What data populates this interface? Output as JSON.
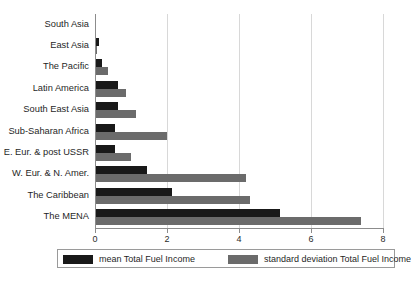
{
  "chart_data": {
    "type": "bar",
    "orientation": "horizontal",
    "title": "",
    "subtitle": "",
    "xlabel": "",
    "ylabel": "",
    "xlim": [
      0,
      8
    ],
    "ylim": null,
    "grid": true,
    "gridlines": "vertical",
    "legend_position": "bottom",
    "xticks": [
      "0",
      "2",
      "4",
      "6",
      "8"
    ],
    "xtick_values": [
      0,
      2,
      4,
      6,
      8
    ],
    "categories": [
      "South Asia",
      "East Asia",
      "The Pacific",
      "Latin America",
      "South East Asia",
      "Sub-Saharan Africa",
      "E. Eur. & post USSR",
      "W. Eur. & N. Amer.",
      "The Caribbean",
      "The MENA"
    ],
    "series": [
      {
        "name": "mean Total Fuel Income",
        "color": "#191919",
        "values": [
          0.02,
          0.1,
          0.2,
          0.65,
          0.65,
          0.55,
          0.55,
          1.45,
          2.15,
          5.15
        ]
      },
      {
        "name": "standard deviation Total Fuel Income",
        "color": "#6b6b6b",
        "values": [
          0.0,
          0.05,
          0.35,
          0.85,
          1.15,
          2.0,
          1.0,
          4.2,
          4.3,
          7.4
        ]
      }
    ]
  },
  "legend": {
    "entries": [
      {
        "label": "mean Total Fuel Income",
        "color": "#191919"
      },
      {
        "label": "standard deviation Total Fuel Income",
        "color": "#6b6b6b"
      }
    ]
  }
}
